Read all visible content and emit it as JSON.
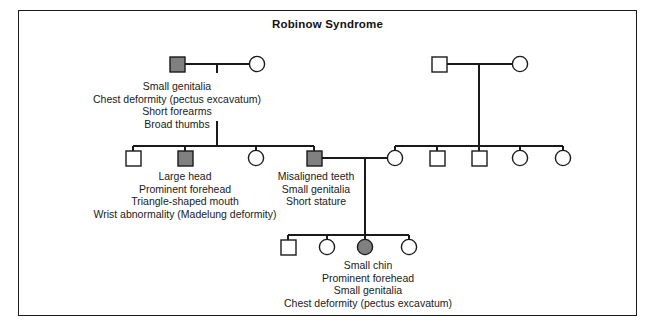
{
  "figure": {
    "title": "Robinow Syndrome",
    "type": "pedigree-chart",
    "width": 655,
    "height": 331,
    "colors": {
      "affected_fill": "#808080",
      "unaffected_fill": "#ffffff",
      "stroke": "#1a1a1a",
      "background": "#ffffff",
      "text": "#1a1a1a"
    }
  },
  "legend_semantics": {
    "square": "male",
    "circle": "female",
    "filled": "affected",
    "open": "unaffected"
  },
  "generations": [
    {
      "id": "generation-1",
      "individuals": [
        {
          "id": "I-1",
          "shape": "square",
          "sex": "male",
          "affected": true,
          "x": 177,
          "y": 64
        },
        {
          "id": "I-2",
          "shape": "circle",
          "sex": "female",
          "affected": false,
          "x": 257,
          "y": 64
        },
        {
          "id": "I-3",
          "shape": "square",
          "sex": "male",
          "affected": false,
          "x": 439,
          "y": 64
        },
        {
          "id": "I-4",
          "shape": "circle",
          "sex": "female",
          "affected": false,
          "x": 520,
          "y": 64
        }
      ]
    },
    {
      "id": "generation-2",
      "individuals": [
        {
          "id": "II-1",
          "shape": "square",
          "sex": "male",
          "affected": false,
          "x": 133,
          "y": 158
        },
        {
          "id": "II-2",
          "shape": "square",
          "sex": "male",
          "affected": true,
          "x": 185,
          "y": 158
        },
        {
          "id": "II-3",
          "shape": "circle",
          "sex": "female",
          "affected": false,
          "x": 256,
          "y": 158
        },
        {
          "id": "II-4",
          "shape": "square",
          "sex": "male",
          "affected": true,
          "x": 314,
          "y": 158
        },
        {
          "id": "II-5",
          "shape": "circle",
          "sex": "female",
          "affected": false,
          "x": 395,
          "y": 158
        },
        {
          "id": "II-6",
          "shape": "square",
          "sex": "male",
          "affected": false,
          "x": 437,
          "y": 158
        },
        {
          "id": "II-7",
          "shape": "square",
          "sex": "male",
          "affected": false,
          "x": 479,
          "y": 158
        },
        {
          "id": "II-8",
          "shape": "circle",
          "sex": "female",
          "affected": false,
          "x": 520,
          "y": 158
        },
        {
          "id": "II-9",
          "shape": "circle",
          "sex": "female",
          "affected": false,
          "x": 563,
          "y": 158
        }
      ]
    },
    {
      "id": "generation-3",
      "individuals": [
        {
          "id": "III-1",
          "shape": "square",
          "sex": "male",
          "affected": false,
          "x": 288,
          "y": 247
        },
        {
          "id": "III-2",
          "shape": "circle",
          "sex": "female",
          "affected": false,
          "x": 327,
          "y": 247
        },
        {
          "id": "III-3",
          "shape": "circle",
          "sex": "female",
          "affected": true,
          "x": 365,
          "y": 247
        },
        {
          "id": "III-4",
          "shape": "circle",
          "sex": "female",
          "affected": false,
          "x": 409,
          "y": 247
        }
      ]
    }
  ],
  "annotations": {
    "proband_top_left": {
      "name": "top-left-affected-male-features",
      "for": "I-1",
      "lines": [
        "Small genitalia",
        "Chest deformity (pectus excavatum)",
        "Short forearms",
        "Broad thumbs"
      ]
    },
    "middle_left": {
      "name": "second-generation-affected-male-features",
      "for": "II-2",
      "lines": [
        "Large head",
        "Prominent forehead",
        "Triangle-shaped mouth",
        "Wrist abnormality (Madelung deformity)"
      ]
    },
    "middle_right": {
      "name": "second-generation-affected-male-2-features",
      "for": "II-4",
      "lines": [
        "Misaligned teeth",
        "Small genitalia",
        "Short stature"
      ]
    },
    "bottom": {
      "name": "third-generation-affected-female-features",
      "for": "III-3",
      "lines": [
        "Small chin",
        "Prominent forehead",
        "Small genitalia",
        "Chest deformity (pectus excavatum)"
      ]
    }
  }
}
